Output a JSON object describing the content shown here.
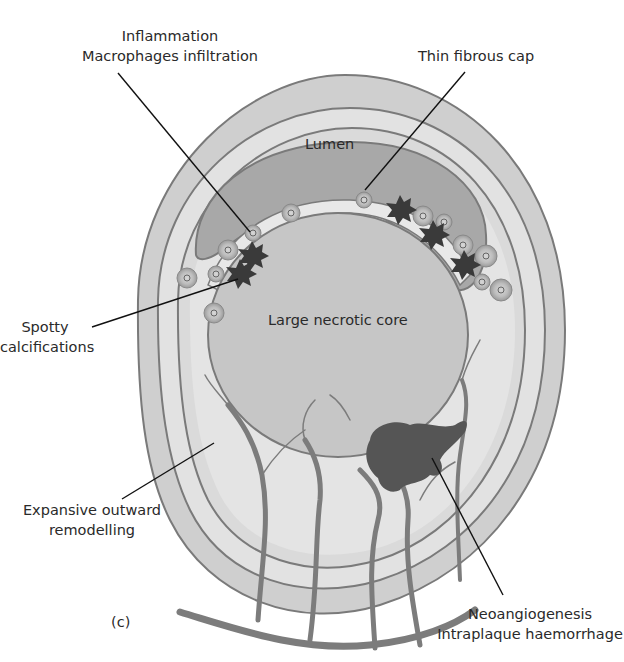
{
  "figure": {
    "panel_label": "(c)",
    "colors": {
      "background": "#ffffff",
      "adventitia": "#cfcfcf",
      "media_band": "#e3e3e3",
      "intima_band": "#d9d9d9",
      "lumen": "#a9a9a9",
      "fibrous_cap": "#e6e6e6",
      "necrotic_core": "#c6c6c6",
      "outline": "#7a7a7a",
      "vessels": "#7c7c7c",
      "haemorrhage": "#4f4f4f",
      "calcification": "#3a3a3a",
      "leader_line": "#111111",
      "text": "#2a2a2a"
    }
  },
  "labels": {
    "inflammation": {
      "line1": "Inflammation",
      "line2": "Macrophages infiltration"
    },
    "thin_fibrous_cap": "Thin fibrous cap",
    "lumen": "Lumen",
    "large_necrotic_core": "Large necrotic core",
    "spotty_calcifications": {
      "line1": "Spotty",
      "line2": "calcifications"
    },
    "expansive_remodelling": {
      "line1": "Expansive outward",
      "line2": "remodelling"
    },
    "neoangiogenesis": {
      "line1": "Neoangiogenesis",
      "line2": "Intraplaque haemorrhage"
    }
  }
}
